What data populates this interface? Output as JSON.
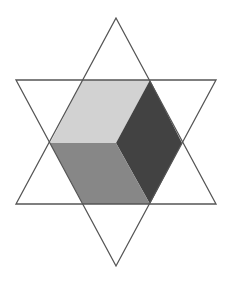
{
  "diagram": {
    "colors": {
      "background": "#ffffff",
      "outline": "#555555",
      "top_rhombus": "#d2d2d2",
      "right_rhombus": "#424242",
      "bottom_left_rhombus": "#878787"
    },
    "triangles": {
      "upward": "116,18 16,204 216,204",
      "downward": "16,80 216,80 116,266"
    },
    "rhombi": {
      "top": "83,80 150,80 116,143 50,143",
      "right": "150,80 182,143 150,204 116,143",
      "bottom_left": "50,143 116,143 150,204 83,204"
    }
  }
}
